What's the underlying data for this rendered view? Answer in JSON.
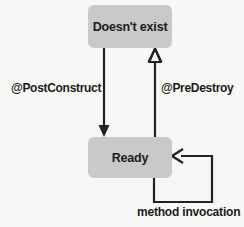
{
  "diagram": {
    "background_color": "#f7f7f5",
    "node_fill_color": "#c9c9c9",
    "stroke_color": "#222222",
    "text_color": "#1c1c1c",
    "states": [
      {
        "id": "doesnt-exist",
        "label": "Doesn't exist"
      },
      {
        "id": "ready",
        "label": "Ready"
      }
    ],
    "transitions": [
      {
        "id": "post-construct",
        "label": "@PostConstruct",
        "from": "doesnt-exist",
        "to": "ready",
        "direction": "down"
      },
      {
        "id": "pre-destroy",
        "label": "@PreDestroy",
        "from": "ready",
        "to": "doesnt-exist",
        "direction": "up"
      },
      {
        "id": "method-invocation",
        "label": "method invocation",
        "from": "ready",
        "to": "ready",
        "direction": "self-loop"
      }
    ]
  }
}
